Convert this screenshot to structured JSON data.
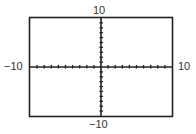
{
  "chart_data": {
    "type": "line",
    "title": "",
    "xlabel": "",
    "ylabel": "",
    "xlim": [
      -10,
      10
    ],
    "ylim": [
      -10,
      10
    ],
    "xscale": 1,
    "yscale": 1,
    "grid": false,
    "series": [],
    "tick_labels": {
      "top": "10",
      "bottom": "-10",
      "left": "-10",
      "right": "10"
    }
  },
  "window": {
    "xmin_label": "−10",
    "xmax_label": "10",
    "ymin_label": "−10",
    "ymax_label": "10"
  },
  "colors": {
    "frame": "#222222",
    "axis": "#222222",
    "background": "#ffffff"
  }
}
